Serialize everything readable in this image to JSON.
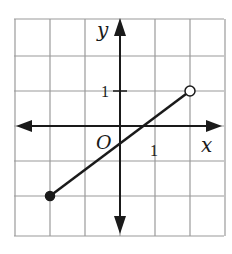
{
  "chart_data": {
    "type": "line",
    "title": "",
    "xlabel": "x",
    "ylabel": "y",
    "origin_label": "O",
    "tick_labels": {
      "x": [
        "1"
      ],
      "y": [
        "1"
      ]
    },
    "xlim": [
      -3,
      3
    ],
    "ylim": [
      -3,
      3
    ],
    "grid": true,
    "series": [
      {
        "name": "segment",
        "x": [
          -2,
          2
        ],
        "y": [
          -2,
          1
        ],
        "start_point": {
          "x": -2,
          "y": -2,
          "style": "closed"
        },
        "end_point": {
          "x": 2,
          "y": 1,
          "style": "open"
        }
      }
    ]
  },
  "colors": {
    "grid": "#9a9a9a",
    "axis": "#1a1a1a",
    "line": "#1a1a1a",
    "background": "#ffffff"
  }
}
